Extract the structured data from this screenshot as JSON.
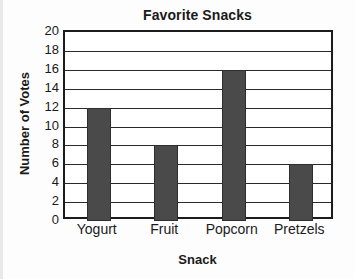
{
  "chart_data": {
    "type": "bar",
    "title": "Favorite Snacks",
    "xlabel": "Snack",
    "ylabel": "Number of Votes",
    "categories": [
      "Yogurt",
      "Fruit",
      "Popcorn",
      "Pretzels"
    ],
    "values": [
      12,
      8,
      16,
      6
    ],
    "ylim": [
      0,
      20
    ],
    "ytick_step": 2,
    "yticks": [
      20,
      18,
      16,
      14,
      12,
      10,
      8,
      6,
      4,
      2,
      0
    ],
    "grid": "horizontal",
    "legend": "none",
    "bar_color": "#4a4a4a",
    "axis_color": "#1c1c1c",
    "background_color": "#ffffff"
  }
}
